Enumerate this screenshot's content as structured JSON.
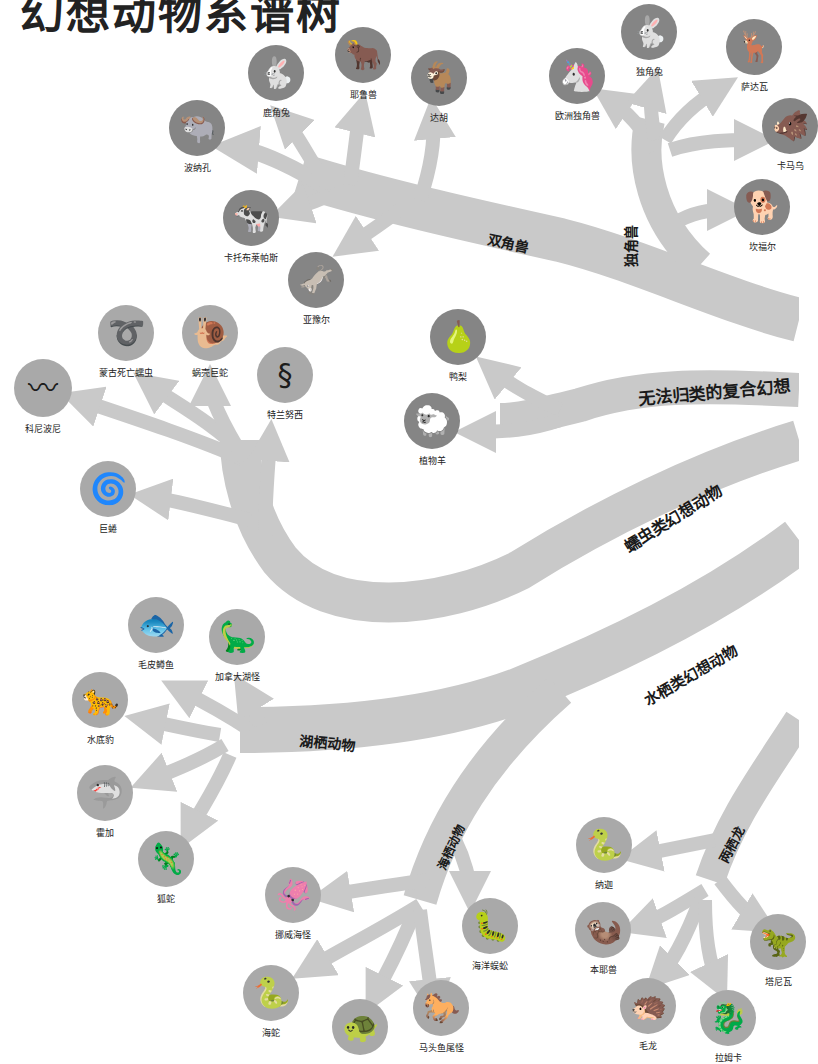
{
  "title": "幻想动物系谱树",
  "colors": {
    "branch": "#c9c9c9",
    "disc_dark": "#858585",
    "disc_light": "#a9a9a9",
    "silhouette": "#1c1c1c",
    "text": "#222222"
  },
  "branches": {
    "two_horned": "双角兽",
    "one_horned": "独角兽",
    "composite": "无法归类的复合幻想",
    "worm": "蠕虫类幻想动物",
    "water": "水栖类幻想动物",
    "lake": "湖栖动物",
    "sea": "海栖动物",
    "amphibious_dragon": "两栖龙"
  },
  "creatures": {
    "luzhuotu": "鹿角兔",
    "yelushou": "耶鲁兽",
    "dahu": "达胡",
    "bonakong": "波纳孔",
    "katuobulaipasi": "卡托布莱帕斯",
    "yayaer": "亚豫尔",
    "ouzhoudujiaoshou": "欧洲独角兽",
    "dujiaotu": "独角兔",
    "sadawa": "萨达瓦",
    "kamawu": "卡马乌",
    "kanfuer": "坎福尔",
    "yali": "鸭梨",
    "zhiwuyang": "植物羊",
    "kenibonie": "科尼波尼",
    "menggusiwangruchong": "蒙古死亡蠕虫",
    "woqiaojushe": "蜗壳巨蛇",
    "telannuxi": "特兰努西",
    "jujuan": "巨蜷",
    "maopizunyu": "毛皮鳟鱼",
    "jianadahuguai": "加拿大湖怪",
    "shuidibao": "水底豹",
    "huojia": "霍加",
    "hushe": "狐蛇",
    "nuoweihaiguai": "挪威海怪",
    "haiyangwugong": "海洋蜈蚣",
    "haishe": "海蛇",
    "haigui": "",
    "matouyuweiguai": "马头鱼尾怪",
    "najia": "纳迦",
    "benyeshou": "本耶兽",
    "maolong": "毛龙",
    "taniwa": "塔尼瓦",
    "bottom_partial": "拉姆卡"
  },
  "icons": {
    "luzhuotu": "🐇",
    "yelushou": "🐂",
    "dahu": "🐐",
    "bonakong": "🐃",
    "katuobulaipasi": "🐄",
    "yayaer": "🫏",
    "ouzhoudujiaoshou": "🦄",
    "dujiaotu": "🐇",
    "sadawa": "🦌",
    "kamawu": "🐗",
    "kanfuer": "🐕",
    "yali": "🍐",
    "zhiwuyang": "🐑",
    "kenibonie": "〰",
    "menggusiwangruchong": "➰",
    "woqiaojushe": "🐌",
    "telannuxi": "§",
    "jujuan": "🌀",
    "maopizunyu": "🐟",
    "jianadahuguai": "🦕",
    "shuidibao": "🐆",
    "huojia": "🦈",
    "hushe": "🦎",
    "nuoweihaiguai": "🦑",
    "haiyangwugong": "🐛",
    "haishe": "🐍",
    "haigui": "🐢",
    "matouyuweiguai": "🐎",
    "najia": "🐍",
    "benyeshou": "🦦",
    "maolong": "🦔",
    "taniwa": "🦖",
    "bottom_partial": "🐉"
  }
}
